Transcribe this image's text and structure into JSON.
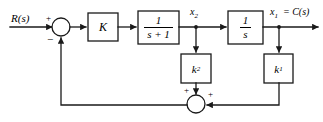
{
  "diagram": {
    "type": "block-diagram",
    "stroke_color": "#1a1a1a",
    "background": "#ffffff",
    "input": {
      "label": "R(s)",
      "sign_at_sum": "+"
    },
    "output": {
      "label_x": "x",
      "label_sub": "1",
      "label_eq": "= C(s)",
      "full_label": "x1 = C(s)"
    },
    "signals": {
      "x2": {
        "name": "x",
        "sub": "2"
      },
      "x1": {
        "name": "x",
        "sub": "1"
      }
    },
    "summing_junctions": [
      {
        "id": "sum-top",
        "signs": {
          "input_left": "+",
          "feedback_bottom": "−"
        }
      },
      {
        "id": "sum-bottom",
        "signs": {
          "input_top": "+",
          "input_right": "+"
        }
      }
    ],
    "blocks": [
      {
        "id": "gain-k",
        "label": "K",
        "kind": "gain"
      },
      {
        "id": "lag-block",
        "numerator": "1",
        "denominator": "s + 1",
        "kind": "transfer-function"
      },
      {
        "id": "integrator-block",
        "numerator": "1",
        "denominator": "s",
        "kind": "transfer-function"
      },
      {
        "id": "gain-k2",
        "label": "k",
        "sub": "2",
        "kind": "feedback-gain"
      },
      {
        "id": "gain-k1",
        "label": "k",
        "sub": "1",
        "kind": "feedback-gain"
      }
    ]
  }
}
